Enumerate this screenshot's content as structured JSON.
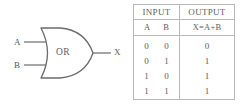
{
  "diagram": {
    "gate_type": "OR",
    "inputs": [
      {
        "label": "A"
      },
      {
        "label": "B"
      }
    ],
    "output": {
      "label": "X"
    }
  },
  "table": {
    "headers": {
      "input": "INPUT",
      "output": "OUTPUT"
    },
    "subheaders": {
      "a": "A",
      "b": "B",
      "expression": "X=A+B"
    },
    "rows": [
      {
        "a": "0",
        "b": "0",
        "x": "0"
      },
      {
        "a": "0",
        "b": "1",
        "x": "1"
      },
      {
        "a": "1",
        "b": "0",
        "x": "1"
      },
      {
        "a": "1",
        "b": "1",
        "x": "1"
      }
    ]
  },
  "colors": {
    "background": "#ffffff",
    "stroke": "#6b6b6d",
    "text": "#5c5c5e",
    "border": "#b9b9bb"
  }
}
